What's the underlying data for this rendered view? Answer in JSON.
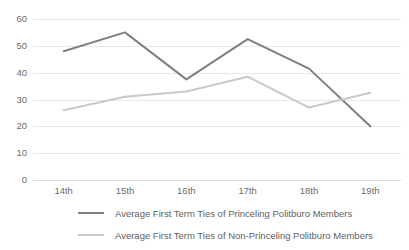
{
  "chart_data": {
    "type": "line",
    "title": "",
    "xlabel": "",
    "ylabel": "",
    "categories": [
      "14th",
      "15th",
      "16th",
      "17th",
      "18th",
      "19th"
    ],
    "ylim": [
      0,
      60
    ],
    "yticks": [
      0,
      10,
      20,
      30,
      40,
      50,
      60
    ],
    "ytick_labels": [
      "0",
      "10",
      "20",
      "30",
      "40",
      "50",
      "60"
    ],
    "grid": true,
    "legend_position": "bottom",
    "series": [
      {
        "name": "Average First Term Ties of Princeling Politburo Members",
        "color": "#808080",
        "values": [
          48,
          55,
          37.5,
          52.5,
          41.5,
          20
        ]
      },
      {
        "name": "Average First Term Ties of Non-Princeling Politburo Members",
        "color": "#c9c9c9",
        "values": [
          26,
          31,
          33,
          38.5,
          27,
          32.5
        ]
      }
    ]
  }
}
